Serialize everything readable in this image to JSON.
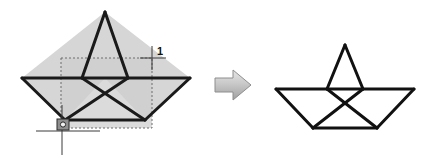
{
  "diagram": {
    "background_color": "#ffffff",
    "stroke_color": "#1a1a1a",
    "fill_color": "#d4d4d4",
    "selection_fill": "#cfcfcf",
    "selection_border_color": "#707070",
    "arrow_color": "#b0b0b0",
    "arrow_outline": "#8a8a8a"
  },
  "left_figure": {
    "name": "selected-polygon",
    "description": "Shaded boat-star polygon with dashed selection rectangle",
    "shape_points": "22,78 105,12 190,78 145,120 105,78 65,120",
    "outline_segments": [
      "22,78 190,78",
      "22,78 65,120",
      "65,120 145,120",
      "145,120 190,78",
      "105,12 82,78",
      "105,12 128,78",
      "82,78 145,120",
      "128,78 65,120"
    ]
  },
  "selection_box": {
    "name": "dashed-selection-rectangle",
    "x": 61,
    "y": 58,
    "width": 91,
    "height": 70
  },
  "point_marker": {
    "name": "base-point-marker",
    "label": "1",
    "handle_x": 63,
    "handle_y": 125,
    "label_x": 157,
    "label_y": 52,
    "crosshair_x": 62,
    "crosshair_y": 125
  },
  "crosshair_top_right": {
    "x": 152,
    "y": 58
  },
  "arrow": {
    "name": "transform-arrow",
    "x": 215,
    "y": 72,
    "width": 36,
    "height": 26,
    "direction": "right"
  },
  "right_figure": {
    "name": "result-polygon",
    "description": "Unshaded boat-star polygon result",
    "outline_segments": [
      "276,89 414,89",
      "276,89 313,128",
      "313,128 377,128",
      "377,128 414,89",
      "345,45 327,89",
      "345,45 363,89",
      "327,89 377,128",
      "363,89 313,128"
    ]
  }
}
